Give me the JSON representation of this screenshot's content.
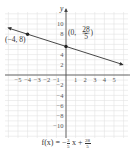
{
  "chart_data": {
    "type": "line",
    "title": "",
    "xlabel": "",
    "ylabel": "y",
    "xlim": [
      -6,
      6
    ],
    "ylim": [
      -12,
      12
    ],
    "grid": true,
    "x_ticks": [
      -5,
      -4,
      -3,
      -2,
      -1,
      1,
      2,
      3,
      4,
      5
    ],
    "y_ticks": [
      10,
      8,
      4,
      2,
      -2,
      -4,
      -6,
      -8,
      -10
    ],
    "series": [
      {
        "name": "f(x) = -3/5 x + 28/5",
        "function": {
          "slope": -0.6,
          "intercept": 5.6
        },
        "x": [
          -6,
          6
        ],
        "values": [
          9.2,
          2.0
        ]
      }
    ],
    "points": [
      {
        "x": -4,
        "y": 8,
        "label": "(−4, 8)"
      },
      {
        "x": 0,
        "y": 5.6,
        "label": "(0, 28/5)"
      }
    ],
    "annotations": [
      "(−4, 8)",
      "(0, 28/5)"
    ]
  },
  "labels": {
    "y_axis": "y",
    "point_a": "(−4, 8)",
    "point_b_prefix": "(0,",
    "point_b_num": "28",
    "point_b_den": "5",
    "point_b_suffix": ")"
  },
  "formula": {
    "lhs": "f(x) = −",
    "frac1_num": "3",
    "frac1_den": "5",
    "mid": "x +",
    "frac2_num": "28",
    "frac2_den": "5"
  },
  "colors": {
    "grid": "#e3e3e3",
    "axis": "#444444",
    "line": "#333333"
  }
}
